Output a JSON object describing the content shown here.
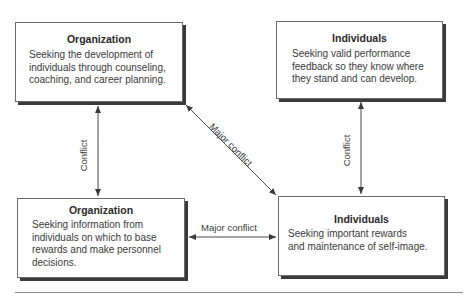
{
  "boxes": {
    "top_left": {
      "title": "Organization",
      "lines": [
        "Seeking the development of",
        "individuals through counseling,",
        "coaching, and career planning."
      ]
    },
    "top_right": {
      "title": "Individuals",
      "lines": [
        "Seeking valid performance",
        "feedback so they know where",
        "they stand and can develop."
      ]
    },
    "bottom_left": {
      "title": "Organization",
      "lines": [
        "Seeking information from",
        "individuals on which to base",
        "rewards and make personnel",
        "decisions."
      ]
    },
    "bottom_right": {
      "title": "Individuals",
      "lines": [
        "Seeking important rewards",
        "and maintenance of self-image."
      ]
    }
  },
  "connectors": {
    "left_vertical": "Conflict",
    "right_vertical": "Conflict",
    "diagonal": "Major conflict",
    "horizontal": "Major conflict"
  },
  "colors": {
    "border": "#6a6a6a",
    "shadow": "#3a3a3a",
    "line": "#4a4a4a",
    "text": "#2a2a2a"
  }
}
